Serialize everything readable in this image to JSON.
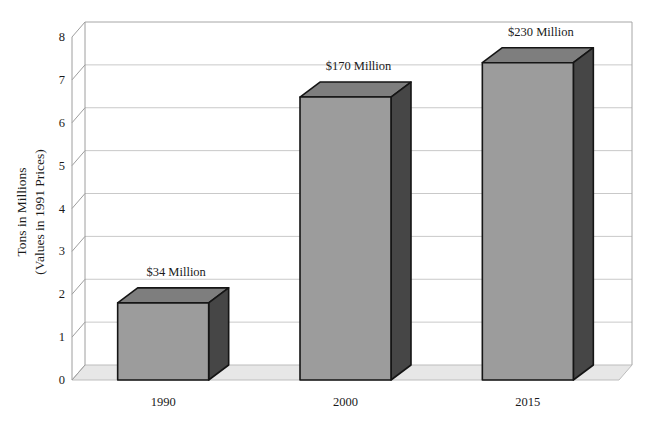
{
  "figure": {
    "background": "#ffffff"
  },
  "y_axis_title": {
    "line1": "Tons in Millions",
    "line2": "(Values in 1991 Prices)"
  },
  "chart_data": {
    "type": "bar",
    "style": "3d-column",
    "title": "",
    "xlabel": "",
    "ylabel": "Tons in Millions (Values in 1991 Prices)",
    "categories": [
      "1990",
      "2000",
      "2015"
    ],
    "values": [
      1.8,
      6.6,
      7.4
    ],
    "bar_value_labels": [
      "$34 Million",
      "$170 Million",
      "$230 Million"
    ],
    "ylim": [
      0,
      8
    ],
    "yticks": [
      0,
      1,
      2,
      3,
      4,
      5,
      6,
      7,
      8
    ],
    "grid": true,
    "legend_position": "none",
    "colors": {
      "bar_front": "#9c9c9c",
      "bar_top": "#7e7e7e",
      "bar_side": "#464646",
      "bar_outline": "#151515",
      "floor_fill": "#e7e7e7",
      "floor_edge": "#bdbdbd",
      "gridline": "#c9c9c9",
      "frame": "#a6a6a6",
      "axis_line": "#9e9e9e",
      "text": "#1a1a1a",
      "background": "#ffffff"
    }
  }
}
